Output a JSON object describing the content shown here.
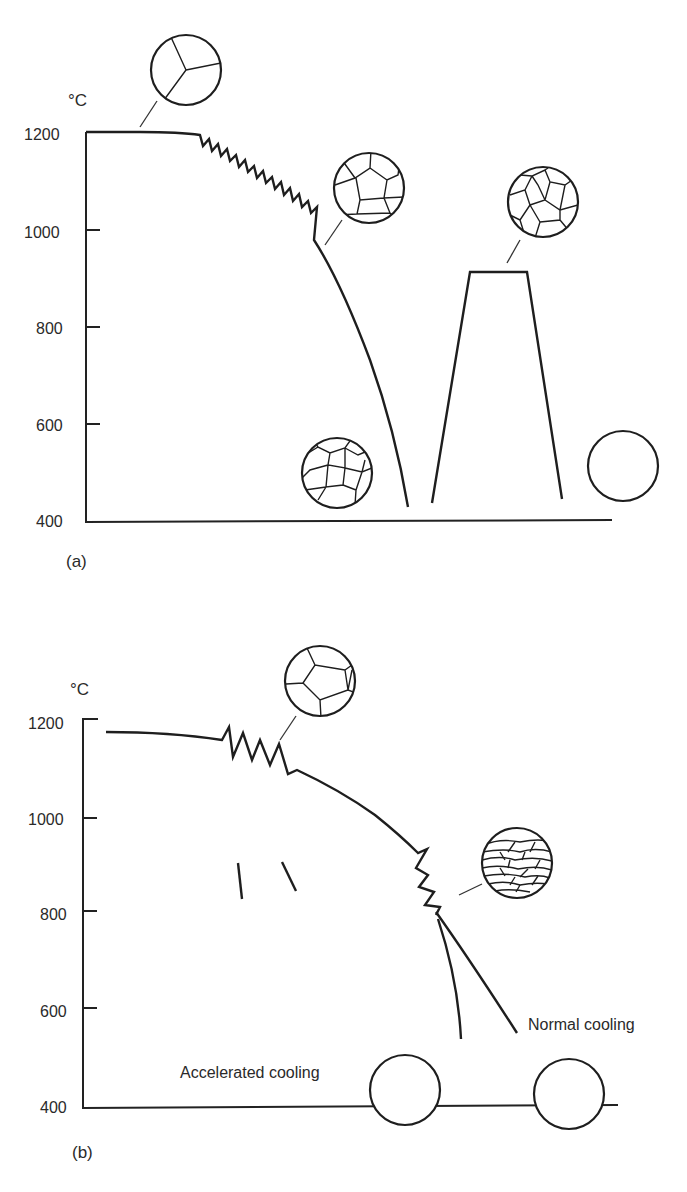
{
  "figure": {
    "panels": [
      {
        "id": "a",
        "label": "(a)",
        "unit": "°C",
        "y_ticks": [
          "1200",
          "1000",
          "800",
          "600",
          "400"
        ],
        "description": "Reheat at 1200°C, multi-pass rolling (zig-zag) down to ~1000°C, cooling; then reheat to ~920°C and cool",
        "micrographs": [
          {
            "name": "coarse-austenite-1200",
            "grain_size": "very coarse"
          },
          {
            "name": "recrystallized-austenite-after-rolling",
            "grain_size": "coarse"
          },
          {
            "name": "ferrite-after-cooling",
            "grain_size": "medium"
          },
          {
            "name": "austenite-after-reheat",
            "grain_size": "medium-fine"
          },
          {
            "name": "ferrite-after-normalizing",
            "grain_size": "fine"
          }
        ]
      },
      {
        "id": "b",
        "label": "(b)",
        "unit": "°C",
        "y_ticks": [
          "1200",
          "1000",
          "800",
          "600",
          "400"
        ],
        "description": "Controlled rolling: roughing passes ~1150°C, finishing passes ~850°C (pancaked austenite), then accelerated or normal cooling",
        "annotations": {
          "accelerated": "Accelerated cooling",
          "normal": "Normal cooling"
        },
        "micrographs": [
          {
            "name": "recrystallized-austenite",
            "grain_size": "coarse"
          },
          {
            "name": "pancaked-austenite",
            "grain_size": "elongated"
          },
          {
            "name": "accelerated-cooled-ferrite",
            "grain_size": "very fine"
          },
          {
            "name": "normal-cooled-ferrite",
            "grain_size": "fine"
          }
        ]
      }
    ]
  }
}
